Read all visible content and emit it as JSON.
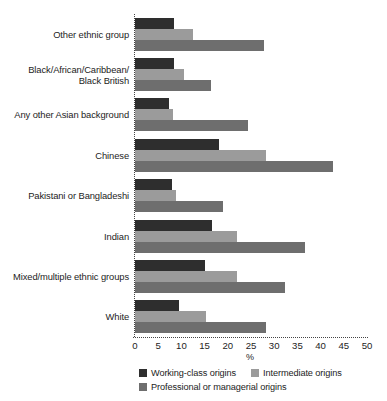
{
  "chart_data": {
    "type": "bar",
    "orientation": "horizontal",
    "title": "",
    "xlabel": "%",
    "ylabel": "",
    "xlim": [
      0,
      50
    ],
    "xticks": [
      0,
      5,
      10,
      15,
      20,
      25,
      30,
      35,
      40,
      45,
      50
    ],
    "grid": false,
    "legend_position": "bottom",
    "categories": [
      "Other ethnic group",
      "Black/African/Caribbean/ Black British",
      "Any other Asian background",
      "Chinese",
      "Pakistani or Bangladeshi",
      "Indian",
      "Mixed/multiple ethnic groups",
      "White"
    ],
    "category_labels_lines": [
      [
        "Other ethnic group"
      ],
      [
        "Black/African/Caribbean/",
        "Black British"
      ],
      [
        "Any other Asian background"
      ],
      [
        "Chinese"
      ],
      [
        "Pakistani or Bangladeshi"
      ],
      [
        "Indian"
      ],
      [
        "Mixed/multiple ethnic groups"
      ],
      [
        "White"
      ]
    ],
    "series": [
      {
        "name": "Working-class origins",
        "color": "#2e2e2e",
        "values": [
          8.4,
          8.4,
          7.4,
          18.0,
          8.0,
          16.6,
          15.1,
          9.5
        ]
      },
      {
        "name": "Intermediate origins",
        "color": "#9b9b9b",
        "values": [
          12.4,
          10.6,
          8.2,
          28.2,
          8.8,
          22.0,
          22.0,
          15.3
        ]
      },
      {
        "name": "Professional or managerial origins",
        "color": "#6e6e6e",
        "values": [
          27.7,
          16.4,
          24.4,
          42.7,
          19.0,
          36.6,
          32.3,
          28.2
        ]
      }
    ]
  }
}
